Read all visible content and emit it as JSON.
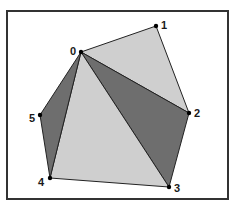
{
  "diagram": {
    "type": "polygon-triangulation",
    "frame": {
      "x": 7,
      "y": 11,
      "width": 221,
      "height": 188,
      "stroke": "#333333"
    },
    "colors": {
      "light_fill": "#cfcfcf",
      "dark_fill": "#6e6e6e",
      "edge": "#222222",
      "vertex": "#000000"
    },
    "vertices": [
      {
        "id": "0",
        "label": "0",
        "x": 81,
        "y": 52,
        "lx": 70,
        "ly": 55
      },
      {
        "id": "1",
        "label": "1",
        "x": 156,
        "y": 26,
        "lx": 161,
        "ly": 29
      },
      {
        "id": "2",
        "label": "2",
        "x": 189,
        "y": 113,
        "lx": 194,
        "ly": 117
      },
      {
        "id": "3",
        "label": "3",
        "x": 169,
        "y": 187,
        "lx": 174,
        "ly": 192
      },
      {
        "id": "4",
        "label": "4",
        "x": 50,
        "y": 178,
        "lx": 38,
        "ly": 186
      },
      {
        "id": "5",
        "label": "5",
        "x": 40,
        "y": 115,
        "lx": 29,
        "ly": 122
      }
    ],
    "triangles": [
      {
        "vertices": [
          "0",
          "1",
          "2"
        ],
        "shade": "light"
      },
      {
        "vertices": [
          "0",
          "2",
          "3"
        ],
        "shade": "dark"
      },
      {
        "vertices": [
          "0",
          "3",
          "4"
        ],
        "shade": "light"
      },
      {
        "vertices": [
          "0",
          "4",
          "5"
        ],
        "shade": "dark"
      }
    ]
  }
}
